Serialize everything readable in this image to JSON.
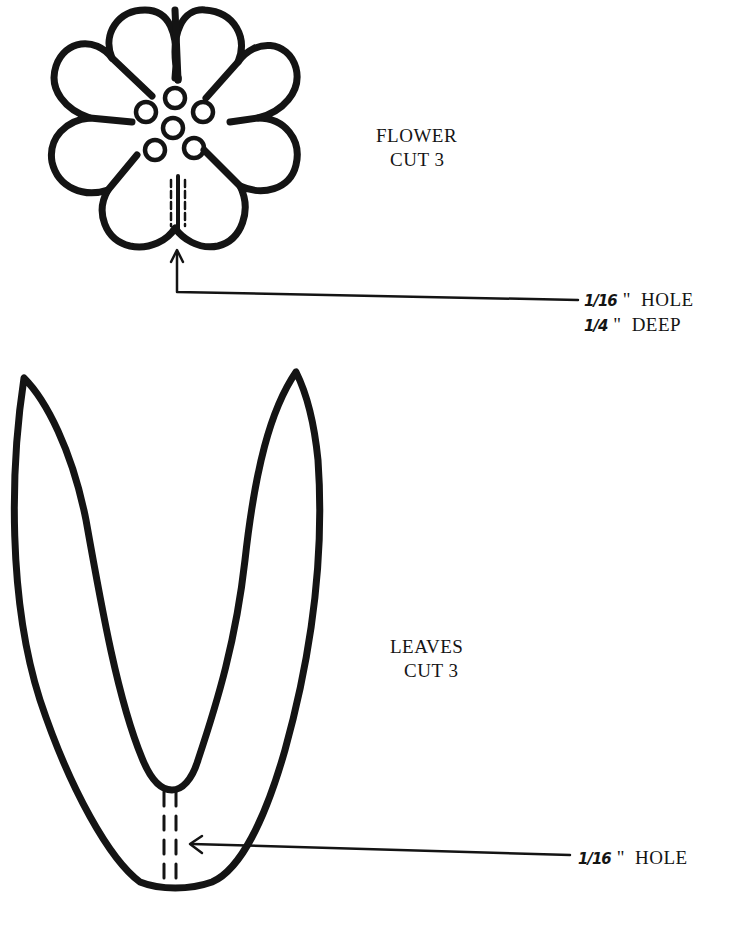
{
  "diagram": {
    "type": "craft-pattern",
    "background_color": "#ffffff",
    "ink_color": "#141414"
  },
  "flower": {
    "label": "FLOWER",
    "cut": "CUT 3",
    "petal_count": 8,
    "center_dot_count": 6,
    "note": {
      "line1": {
        "fraction": "1/16",
        "quote": "\"",
        "text": "HOLE"
      },
      "line2": {
        "fraction": "1/4",
        "quote": "\"",
        "text": "DEEP"
      }
    }
  },
  "leaves": {
    "label": "LEAVES",
    "cut": "CUT 3",
    "note": {
      "fraction": "1/16",
      "quote": "\"",
      "text": "HOLE"
    }
  }
}
